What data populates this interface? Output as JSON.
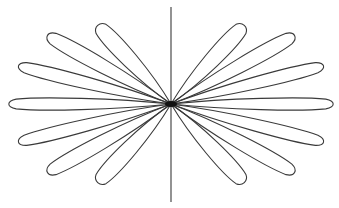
{
  "figure": {
    "stroke_color": "#3a3a3a",
    "background": "#ffffff",
    "center": [
      171,
      104
    ],
    "vertical_axis": {
      "x": 171,
      "y1": 7,
      "y2": 202
    },
    "petals": [
      {
        "angle": 180,
        "length": 163,
        "width": 13
      },
      {
        "angle": 166,
        "length": 158,
        "width": 14
      },
      {
        "angle": 151,
        "length": 142,
        "width": 16
      },
      {
        "angle": 133,
        "length": 108,
        "width": 18
      },
      {
        "angle": 194,
        "length": 158,
        "width": 14
      },
      {
        "angle": 209,
        "length": 142,
        "width": 16
      },
      {
        "angle": 227,
        "length": 108,
        "width": 18
      },
      {
        "angle": 0,
        "length": 163,
        "width": 13
      },
      {
        "angle": 14,
        "length": 158,
        "width": 14
      },
      {
        "angle": 29,
        "length": 142,
        "width": 16
      },
      {
        "angle": 47,
        "length": 108,
        "width": 18
      },
      {
        "angle": -14,
        "length": 158,
        "width": 14
      },
      {
        "angle": -29,
        "length": 142,
        "width": 16
      },
      {
        "angle": -47,
        "length": 108,
        "width": 18
      }
    ]
  }
}
